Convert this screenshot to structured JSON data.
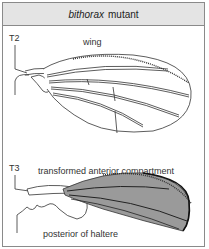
{
  "figure": {
    "title_italic": "bithorax",
    "title_rest": "mutant"
  },
  "top_panel": {
    "segment_label": "T2",
    "structure_label": "wing"
  },
  "bottom_panel": {
    "segment_label": "T3",
    "top_annotation": "transformed anterior compartment",
    "bottom_annotation": "posterior of haltere"
  },
  "colors": {
    "header_bg": "#e4e4e4",
    "border": "#8a8a8a",
    "line": "#333333",
    "transformed_fill": "#9a9a9a"
  }
}
